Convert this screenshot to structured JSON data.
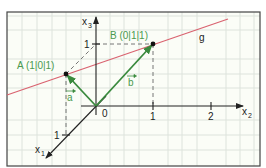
{
  "diagram": {
    "title": "",
    "colors": {
      "background": "#fbfdf7",
      "grid": "#dde3dc",
      "frame": "#444444",
      "axis": "#222222",
      "line_g": "#d9626f",
      "vector": "#3a8a3e",
      "label_green": "#4a9a4e",
      "label_black": "#222222",
      "dashed": "#666666"
    },
    "axes": {
      "x1": {
        "label": "x",
        "subscript": "1",
        "tick_label": "1"
      },
      "x2": {
        "label": "x",
        "subscript": "2",
        "tick_labels": [
          "1",
          "2"
        ]
      },
      "x3": {
        "label": "x",
        "subscript": "3",
        "tick_label": "1"
      },
      "origin_label": "0"
    },
    "points": [
      {
        "name": "A",
        "label": "A (1|0|1)",
        "coords": [
          1,
          0,
          1
        ]
      },
      {
        "name": "B",
        "label": "B (0|1|1)",
        "coords": [
          0,
          1,
          1
        ]
      }
    ],
    "vectors": [
      {
        "name": "a",
        "label": "a",
        "from": "0",
        "to": "A"
      },
      {
        "name": "b",
        "label": "b",
        "from": "0",
        "to": "B"
      }
    ],
    "line": {
      "name": "g",
      "label": "g",
      "through": [
        "A",
        "B"
      ]
    }
  }
}
